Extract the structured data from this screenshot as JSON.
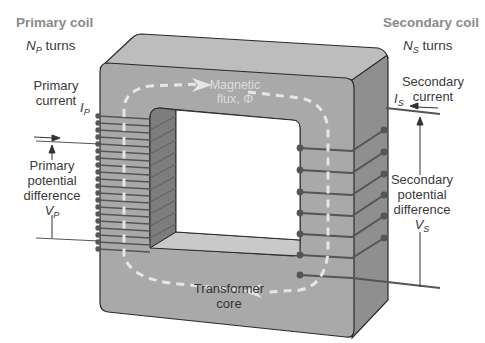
{
  "primary": {
    "title": "Primary coil",
    "turns_symbol": "N",
    "turns_sub": "P",
    "turns_word": " turns",
    "current_label_1": "Primary",
    "current_label_2": "current",
    "current_symbol": "I",
    "current_sub": "P",
    "pd_label_1": "Primary",
    "pd_label_2": "potential",
    "pd_label_3": "difference",
    "pd_symbol": "V",
    "pd_sub": "P",
    "winding_count": 20
  },
  "secondary": {
    "title": "Secondary coil",
    "turns_symbol": "N",
    "turns_sub": "S",
    "turns_word": " turns",
    "current_label_1": "Secondary",
    "current_label_2": "current",
    "current_symbol": "I",
    "current_sub": "S",
    "pd_label_1": "Secondary",
    "pd_label_2": "potential",
    "pd_label_3": "difference",
    "pd_symbol": "V",
    "pd_sub": "S",
    "winding_count": 7
  },
  "core": {
    "label_1": "Transformer",
    "label_2": "core",
    "flux_label_1": "Magnetic",
    "flux_label_2": "flux, Φ"
  },
  "colors": {
    "core_front": "#a9a9a9",
    "core_top": "#bdbdbd",
    "core_side": "#8f8f8f",
    "wire": "#5a5a5a",
    "flux_path": "#e6e6e6",
    "title_text": "#8a8a8a",
    "label_text": "#3a3a3a"
  }
}
